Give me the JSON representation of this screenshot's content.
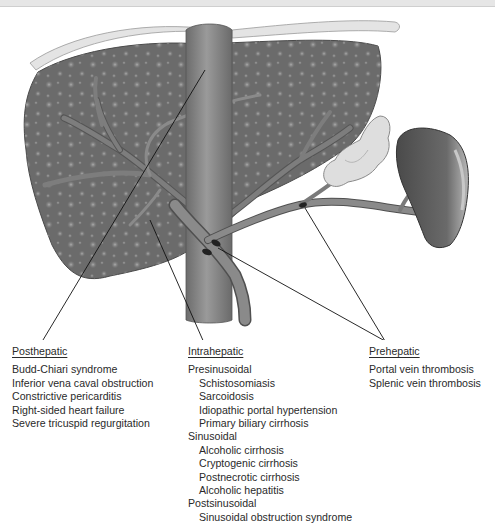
{
  "figure": {
    "topic": "Causes of portal hypertension",
    "illustration_parts": [
      "liver",
      "inferior-vena-cava",
      "portal-vein",
      "splenic-vein",
      "pancreas",
      "spleen"
    ]
  },
  "groups": {
    "posthepatic": {
      "title": "Posthepatic",
      "items": [
        "Budd-Chiari syndrome",
        "Inferior vena caval obstruction",
        "Constrictive pericarditis",
        "Right-sided heart failure",
        "Severe tricuspid regurgitation"
      ]
    },
    "intrahepatic": {
      "title": "Intrahepatic",
      "sections": [
        {
          "label": "Presinusoidal",
          "items": [
            "Schistosomiasis",
            "Sarcoidosis",
            "Idiopathic portal hypertension",
            "Primary biliary cirrhosis"
          ]
        },
        {
          "label": "Sinusoidal",
          "items": [
            "Alcoholic cirrhosis",
            "Cryptogenic cirrhosis",
            "Postnecrotic cirrhosis",
            "Alcoholic hepatitis"
          ]
        },
        {
          "label": "Postsinusoidal",
          "items": [
            "Sinusoidal obstruction syndrome"
          ]
        }
      ]
    },
    "prehepatic": {
      "title": "Prehepatic",
      "items": [
        "Portal vein thrombosis",
        "Splenic vein thrombosis"
      ]
    }
  },
  "colors": {
    "liver": "#6e6e6e",
    "liver_nodule": "#9a9a9a",
    "capsule": "#e2e2e2",
    "vessel": "#7a7a7a",
    "ivc": "#858585",
    "pancreas": "#dcdcdc",
    "spleen": "#5e5e5e",
    "leader_line": "#111111",
    "text": "#2a2a2a"
  }
}
